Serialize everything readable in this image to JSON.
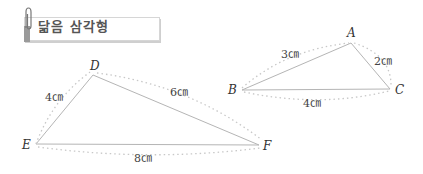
{
  "banner": {
    "title": "닮음 삼각형",
    "icon": "paperclip-icon"
  },
  "triangles": [
    {
      "name": "triangle-DEF",
      "vertices": {
        "D": "D",
        "E": "E",
        "F": "F"
      },
      "sides": {
        "DE": "4㎝",
        "DF": "6㎝",
        "EF": "8㎝"
      }
    },
    {
      "name": "triangle-ABC",
      "vertices": {
        "A": "A",
        "B": "B",
        "C": "C"
      },
      "sides": {
        "AB": "3㎝",
        "AC": "2㎝",
        "BC": "4㎝"
      }
    }
  ],
  "colors": {
    "line": "#b0b0b0",
    "dots": "#c8c8c8",
    "text": "#333333"
  }
}
